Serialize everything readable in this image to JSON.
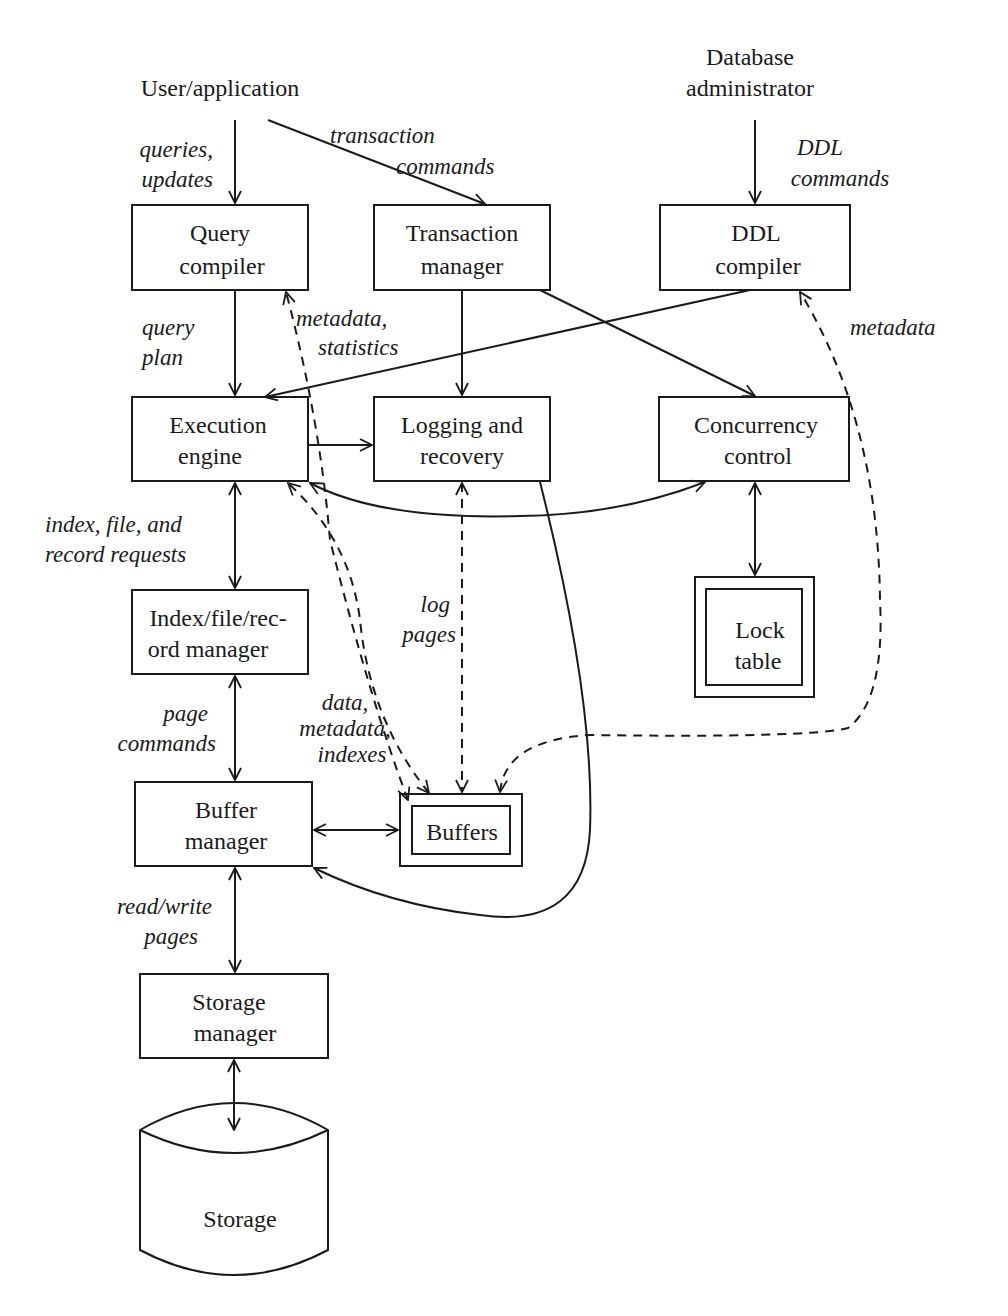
{
  "actors": {
    "user": "User/application",
    "dba_line1": "Database",
    "dba_line2": "administrator"
  },
  "components": {
    "query_compiler": [
      "Query",
      "compiler"
    ],
    "transaction_manager": [
      "Transaction",
      "manager"
    ],
    "ddl_compiler": [
      "DDL",
      "compiler"
    ],
    "execution_engine": [
      "Execution",
      "engine"
    ],
    "logging_recovery": [
      "Logging and",
      "recovery"
    ],
    "concurrency_control": [
      "Concurrency",
      "control"
    ],
    "index_file_record_manager": [
      "Index/file/rec-",
      "ord manager"
    ],
    "lock_table": [
      "Lock",
      "table"
    ],
    "buffer_manager": [
      "Buffer",
      "manager"
    ],
    "buffers": "Buffers",
    "storage_manager": [
      "Storage",
      "manager"
    ],
    "storage": "Storage"
  },
  "edge_labels": {
    "queries_updates": [
      "queries,",
      "updates"
    ],
    "transaction_commands": [
      "transaction",
      "commands"
    ],
    "ddl_commands": [
      "DDL",
      "commands"
    ],
    "query_plan": [
      "query",
      "plan"
    ],
    "metadata_statistics": [
      "metadata,",
      "statistics"
    ],
    "metadata": "metadata",
    "index_file_record_requests": [
      "index, file, and",
      "record requests"
    ],
    "log_pages": [
      "log",
      "pages"
    ],
    "page_commands": [
      "page",
      "commands"
    ],
    "data_metadata_indexes": [
      "data,",
      "metadata,",
      "indexes"
    ],
    "read_write_pages": [
      "read/write",
      "pages"
    ]
  },
  "colors": {
    "stroke": "#1a1a1a",
    "background": "#ffffff"
  }
}
